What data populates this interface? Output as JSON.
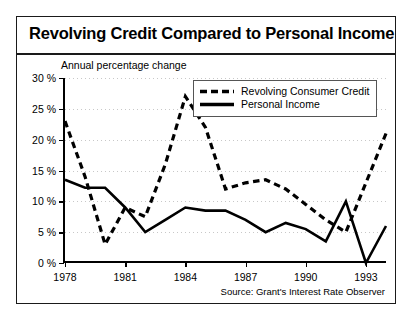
{
  "figure": {
    "title": "Revolving Credit Compared to Personal Income",
    "subtitle": "Annual percentage change",
    "source": "Source: Grant's Interest Rate Observer"
  },
  "chart_data": {
    "type": "line",
    "title": "Revolving Credit Compared to Personal Income",
    "subtitle": "Annual percentage change",
    "xlabel": "",
    "ylabel": "Annual percentage change",
    "ylim": [
      0,
      30
    ],
    "xlim": [
      1978,
      1994
    ],
    "yticks": [
      0,
      5,
      10,
      15,
      20,
      25,
      30
    ],
    "ytick_labels": [
      "0 %",
      "5 %",
      "10 %",
      "15 %",
      "20 %",
      "25 %",
      "30 %"
    ],
    "xticks": [
      1978,
      1981,
      1984,
      1987,
      1990,
      1993
    ],
    "xtick_labels": [
      "1978",
      "1981",
      "1984",
      "1987",
      "1990",
      "1993"
    ],
    "grid": "horizontal-dotted",
    "legend_position": "top-right",
    "x": [
      1978,
      1979,
      1980,
      1981,
      1982,
      1983,
      1984,
      1985,
      1986,
      1987,
      1988,
      1989,
      1990,
      1991,
      1992,
      1993,
      1994
    ],
    "series": [
      {
        "name": "Revolving Consumer Credit",
        "style": "dashed",
        "color": "#000000",
        "values": [
          23.0,
          14.0,
          3.0,
          9.0,
          7.5,
          16.0,
          27.0,
          22.0,
          12.0,
          13.0,
          13.5,
          12.0,
          9.5,
          7.0,
          5.0,
          13.0,
          21.0
        ]
      },
      {
        "name": "Personal Income",
        "style": "solid",
        "color": "#000000",
        "values": [
          13.5,
          12.2,
          12.2,
          9.0,
          5.0,
          7.0,
          9.0,
          8.5,
          8.5,
          7.0,
          5.0,
          6.5,
          5.5,
          3.5,
          10.0,
          0.0,
          6.0
        ]
      }
    ],
    "source": "Source: Grant's Interest Rate Observer"
  },
  "legend": {
    "items": [
      {
        "label": "Revolving Consumer Credit",
        "style": "dashed"
      },
      {
        "label": "Personal Income",
        "style": "solid"
      }
    ]
  }
}
